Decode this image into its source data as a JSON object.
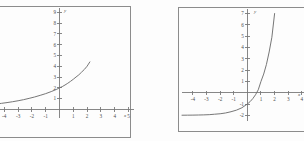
{
  "page": {
    "background_color": "#fdfdfd",
    "line_color": "#7a7a7a",
    "curve_color": "#6f6f6f",
    "frame_color": "#8c8c8c",
    "label_color": "#4d4d4d"
  },
  "chart_data": [
    {
      "type": "line",
      "id": "left-graph",
      "title": "",
      "xlabel": "x",
      "ylabel": "y",
      "xlim": [
        -4.6,
        5.4
      ],
      "ylim": [
        -0.8,
        9.4
      ],
      "grid": false,
      "legend": "none",
      "xticks": [
        -4,
        -3,
        -2,
        -1,
        1,
        2,
        3,
        4,
        5
      ],
      "xtick_labels": [
        "-4",
        "-3",
        "-2",
        "-1",
        "1",
        "2",
        "3",
        "4",
        "5"
      ],
      "yticks": [
        1,
        2,
        3,
        4,
        5,
        6,
        7,
        8,
        9
      ],
      "ytick_labels": [
        "1",
        "2",
        "3",
        "4",
        "5",
        "6",
        "7",
        "8",
        "9"
      ],
      "annotations": [],
      "series": [
        {
          "name": "exponential",
          "asymptote": 0,
          "y_intercept": 2,
          "x": [
            -4.6,
            -4.2,
            -3.8,
            -3.4,
            -3.0,
            -2.6,
            -2.2,
            -1.8,
            -1.4,
            -1.0,
            -0.6,
            -0.2,
            0.0,
            0.2,
            0.4,
            0.6,
            0.8,
            1.0,
            1.2,
            1.4,
            1.6,
            1.8,
            2.0,
            2.1,
            2.2
          ],
          "values": [
            0.49,
            0.56,
            0.63,
            0.71,
            0.8,
            0.9,
            1.02,
            1.15,
            1.3,
            1.46,
            1.65,
            1.86,
            2.0,
            2.11,
            2.26,
            2.42,
            2.6,
            2.79,
            3.0,
            3.2,
            3.45,
            3.7,
            4.0,
            4.2,
            4.4
          ]
        }
      ]
    },
    {
      "type": "line",
      "id": "right-graph",
      "title": "",
      "xlabel": "x",
      "ylabel": "y",
      "xlim": [
        -4.8,
        4.6
      ],
      "ylim": [
        -2.5,
        7.4
      ],
      "grid": false,
      "legend": "none",
      "xticks": [
        -4,
        -3,
        -2,
        -1,
        1,
        2,
        3,
        4
      ],
      "xtick_labels": [
        "-4",
        "-3",
        "-2",
        "-1",
        "1",
        "2",
        "3",
        "4"
      ],
      "yticks": [
        -2,
        -1,
        1,
        2,
        3,
        4,
        5,
        6,
        7
      ],
      "ytick_labels": [
        "-2",
        "-1",
        "1",
        "2",
        "3",
        "4",
        "5",
        "6",
        "7"
      ],
      "annotations": [],
      "series": [
        {
          "name": "exponential-shifted",
          "asymptote": -2,
          "y_intercept": -1,
          "x_intercept": 1,
          "x": [
            -4.8,
            -4.4,
            -4.0,
            -3.6,
            -3.2,
            -2.8,
            -2.4,
            -2.0,
            -1.6,
            -1.2,
            -0.8,
            -0.4,
            0.0,
            0.2,
            0.4,
            0.6,
            0.8,
            1.0,
            1.2,
            1.4,
            1.6,
            1.8,
            2.0,
            2.1,
            2.2
          ],
          "values": [
            -1.99,
            -1.985,
            -1.98,
            -1.97,
            -1.96,
            -1.94,
            -1.9,
            -1.86,
            -1.79,
            -1.68,
            -1.54,
            -1.33,
            -1.0,
            -0.79,
            -0.52,
            -0.18,
            0.26,
            1.0,
            1.65,
            2.5,
            3.6,
            4.9,
            7.0,
            7.8,
            8.6
          ]
        }
      ]
    }
  ]
}
